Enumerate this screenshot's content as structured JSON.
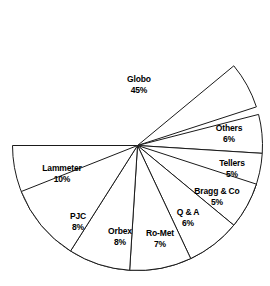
{
  "chart_data": {
    "type": "pie",
    "title": "",
    "subtitle": "",
    "xlabel": "",
    "ylabel": "",
    "legend_position": "none",
    "grid": false,
    "labels_inside_slices": true,
    "value_unit": "%",
    "start_angle_deg": 180,
    "direction": "clockwise",
    "categories": [
      "Globo",
      "Others",
      "Tellers",
      "Bragg & Co",
      "Q & A",
      "Ro-Met",
      "Orbex",
      "PJC",
      "Lammeter"
    ],
    "values": [
      45,
      6,
      5,
      5,
      6,
      7,
      8,
      8,
      10
    ],
    "slices": [
      {
        "name": "Globo",
        "value": 45,
        "value_label": "45%",
        "start_deg": 180,
        "sweep_deg": 162,
        "label_x": 139,
        "label_y": 84,
        "color": "#ffffff"
      },
      {
        "name": "Others",
        "value": 6,
        "value_label": "6%",
        "start_deg": 18,
        "sweep_deg": 21.6,
        "label_x": 229,
        "label_y": 133,
        "color": "#ffffff"
      },
      {
        "name": "Tellers",
        "value": 5,
        "value_label": "5%",
        "start_deg": 356.4,
        "sweep_deg": 18,
        "label_x": 232,
        "label_y": 168,
        "color": "#ffffff"
      },
      {
        "name": "Bragg & Co",
        "value": 5,
        "value_label": "5%",
        "start_deg": 338.4,
        "sweep_deg": 18,
        "label_x": 217,
        "label_y": 196,
        "color": "#ffffff"
      },
      {
        "name": "Q & A",
        "value": 6,
        "value_label": "6%",
        "start_deg": 320.4,
        "sweep_deg": 21.6,
        "label_x": 188,
        "label_y": 217,
        "color": "#ffffff"
      },
      {
        "name": "Ro-Met",
        "value": 7,
        "value_label": "7%",
        "start_deg": 295.2,
        "sweep_deg": 25.2,
        "label_x": 160,
        "label_y": 238,
        "color": "#ffffff"
      },
      {
        "name": "Orbex",
        "value": 8,
        "value_label": "8%",
        "start_deg": 266.4,
        "sweep_deg": 28.8,
        "label_x": 120,
        "label_y": 236,
        "color": "#ffffff"
      },
      {
        "name": "PJC",
        "value": 8,
        "value_label": "8%",
        "start_deg": 237.6,
        "sweep_deg": 28.8,
        "label_x": 78,
        "label_y": 221,
        "color": "#ffffff"
      },
      {
        "name": "Lammeter",
        "value": 10,
        "value_label": "10%",
        "start_deg": 201.6,
        "sweep_deg": 36,
        "label_x": 62,
        "label_y": 173,
        "color": "#ffffff"
      }
    ],
    "geometry": {
      "center_x": 137.5,
      "center_y": 145.5,
      "radius": 125
    },
    "style": {
      "background": "#ffffff",
      "stroke": "#1a1a1a",
      "text": "#000000"
    }
  }
}
